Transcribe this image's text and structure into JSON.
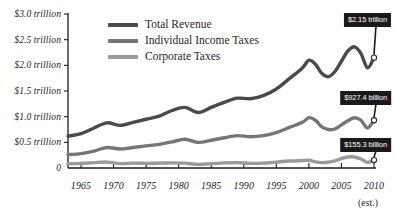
{
  "chart_data": {
    "type": "line",
    "title": "",
    "xlabel": "",
    "ylabel": "",
    "xlim": [
      1963,
      2010
    ],
    "ylim": [
      0,
      3.0
    ],
    "grid": false,
    "legend_position": "top-center",
    "x_ticks": [
      "1965",
      "1970",
      "1975",
      "1980",
      "1985",
      "1990",
      "1995",
      "2000",
      "2005",
      "2010"
    ],
    "x_tick_values": [
      1965,
      1970,
      1975,
      1980,
      1985,
      1990,
      1995,
      2000,
      2005,
      2010
    ],
    "x_axis_note": "(est.)",
    "y_ticks": [
      "0",
      "$0.5 trillion",
      "$1.0 trillion",
      "$1.5 trillion",
      "$2.0 trillion",
      "$2.5 trillion",
      "$3.0 trillion"
    ],
    "y_tick_values": [
      0,
      0.5,
      1.0,
      1.5,
      2.0,
      2.5,
      3.0
    ],
    "y_units": "trillions of dollars",
    "series": [
      {
        "name": "Total Revenue",
        "color": "#4a4a4a",
        "end_label": "$2.15 trillion",
        "end_value": 2.15,
        "x": [
          1963,
          1965,
          1967,
          1969,
          1971,
          1973,
          1975,
          1977,
          1979,
          1981,
          1983,
          1985,
          1987,
          1989,
          1991,
          1993,
          1995,
          1997,
          1999,
          2000,
          2001,
          2002,
          2003,
          2004,
          2005,
          2006,
          2007,
          2008,
          2009,
          2010
        ],
        "values": [
          0.62,
          0.67,
          0.78,
          0.88,
          0.83,
          0.89,
          0.95,
          1.01,
          1.12,
          1.18,
          1.08,
          1.18,
          1.28,
          1.36,
          1.35,
          1.41,
          1.54,
          1.74,
          1.95,
          2.1,
          2.02,
          1.84,
          1.78,
          1.88,
          2.08,
          2.28,
          2.36,
          2.23,
          1.95,
          2.15
        ]
      },
      {
        "name": "Individual Income Taxes",
        "color": "#767676",
        "end_label": "$927.4 billion",
        "end_value": 0.9274,
        "x": [
          1963,
          1965,
          1967,
          1969,
          1971,
          1973,
          1975,
          1977,
          1979,
          1981,
          1983,
          1985,
          1987,
          1989,
          1991,
          1993,
          1995,
          1997,
          1999,
          2000,
          2001,
          2002,
          2003,
          2004,
          2005,
          2006,
          2007,
          2008,
          2009,
          2010
        ],
        "values": [
          0.26,
          0.28,
          0.33,
          0.4,
          0.37,
          0.4,
          0.43,
          0.46,
          0.51,
          0.56,
          0.5,
          0.54,
          0.59,
          0.63,
          0.61,
          0.63,
          0.69,
          0.79,
          0.89,
          0.98,
          0.93,
          0.8,
          0.75,
          0.76,
          0.84,
          0.92,
          0.98,
          0.93,
          0.78,
          0.93
        ]
      },
      {
        "name": "Corporate Taxes",
        "color": "#9a9a9a",
        "end_label": "$155.3 billion",
        "end_value": 0.1553,
        "x": [
          1963,
          1965,
          1967,
          1969,
          1971,
          1973,
          1975,
          1977,
          1979,
          1981,
          1983,
          1985,
          1987,
          1989,
          1991,
          1993,
          1995,
          1997,
          1999,
          2000,
          2001,
          2002,
          2003,
          2004,
          2005,
          2006,
          2007,
          2008,
          2009,
          2010
        ],
        "values": [
          0.085,
          0.09,
          0.105,
          0.115,
          0.085,
          0.095,
          0.09,
          0.095,
          0.1,
          0.095,
          0.07,
          0.085,
          0.1,
          0.105,
          0.09,
          0.095,
          0.115,
          0.135,
          0.145,
          0.15,
          0.12,
          0.105,
          0.115,
          0.14,
          0.185,
          0.215,
          0.215,
          0.175,
          0.11,
          0.155
        ]
      }
    ]
  },
  "legend": {
    "items": [
      {
        "label": "Total Revenue",
        "color": "#4a4a4a"
      },
      {
        "label": "Individual Income Taxes",
        "color": "#767676"
      },
      {
        "label": "Corporate Taxes",
        "color": "#9a9a9a"
      }
    ]
  },
  "callouts": [
    {
      "label": "$2.15 trillion"
    },
    {
      "label": "$927.4 billion"
    },
    {
      "label": "$155.3 billion"
    }
  ]
}
